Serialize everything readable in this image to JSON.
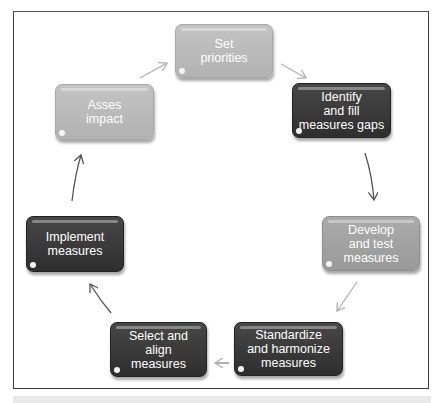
{
  "diagram": {
    "type": "cycle",
    "steps": [
      {
        "id": "set-priorities",
        "label": "Set priorities",
        "lines": [
          "Set",
          "priorities"
        ],
        "shade": "light"
      },
      {
        "id": "identify-gaps",
        "label": "Identify and fill measures gaps",
        "lines": [
          "Identify",
          "and fill",
          "measures gaps"
        ],
        "shade": "dark"
      },
      {
        "id": "develop-test",
        "label": "Develop and test measures",
        "lines": [
          "Develop",
          "and test",
          "measures"
        ],
        "shade": "medium"
      },
      {
        "id": "standardize",
        "label": "Standardize and harmonize measures",
        "lines": [
          "Standardize",
          "and harmonize",
          "measures"
        ],
        "shade": "dark"
      },
      {
        "id": "select-align",
        "label": "Select and align measures",
        "lines": [
          "Select and",
          "align",
          "measures"
        ],
        "shade": "dark"
      },
      {
        "id": "implement",
        "label": "Implement measures",
        "lines": [
          "Implement",
          "measures"
        ],
        "shade": "dark"
      },
      {
        "id": "assess",
        "label": "Asses impact",
        "lines": [
          "Asses",
          "impact"
        ],
        "shade": "light"
      }
    ],
    "edges": [
      {
        "from": "set-priorities",
        "to": "identify-gaps"
      },
      {
        "from": "identify-gaps",
        "to": "develop-test"
      },
      {
        "from": "develop-test",
        "to": "standardize"
      },
      {
        "from": "standardize",
        "to": "select-align"
      },
      {
        "from": "select-align",
        "to": "implement"
      },
      {
        "from": "implement",
        "to": "assess"
      },
      {
        "from": "assess",
        "to": "set-priorities"
      }
    ],
    "colors": {
      "light": "#b8b8b8",
      "medium": "#a0a0a0",
      "dark": "#383838",
      "text": "#ffffff"
    }
  }
}
